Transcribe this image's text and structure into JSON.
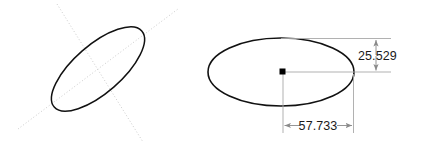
{
  "drawing": {
    "title": "Ellipse dimension drawing",
    "background_color": "#ffffff",
    "outline_color": "#111111",
    "construction_color": "#c9c9c9",
    "dimension_color": "#8a8a8a",
    "text_color": "#1a1a1a",
    "center_point_color": "#000000"
  },
  "figures": {
    "left": {
      "name": "tilted-ellipse",
      "center_x": 98,
      "center_y": 69,
      "semi_major": 58,
      "semi_minor": 24,
      "rotation_deg": -41,
      "axes_visible": true,
      "axis_style": "dotted"
    },
    "right": {
      "name": "horizontal-ellipse",
      "center_x": 281,
      "center_y": 72,
      "semi_major": 72,
      "semi_minor": 34,
      "rotation_deg": 0,
      "center_marker": true
    }
  },
  "dimensions": {
    "vertical": {
      "label": "25.529",
      "value": 25.529,
      "orientation": "vertical",
      "measures": "semi-minor-axis"
    },
    "horizontal": {
      "label": "57.733",
      "value": 57.733,
      "orientation": "horizontal",
      "measures": "semi-major-axis"
    }
  }
}
